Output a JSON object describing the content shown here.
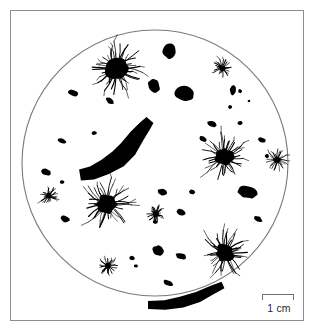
{
  "figure": {
    "caption_visible": false,
    "background_color": "#ffffff",
    "frame": {
      "border_color": "#8d8d8d",
      "x": 10,
      "y": 10,
      "width": 294,
      "height": 311
    },
    "field_of_view": {
      "shape": "circle",
      "outline_color": "#7a7a7a",
      "fill_color": "#ffffff",
      "center_x": 155,
      "center_y": 163,
      "radius": 133
    },
    "scale_bar": {
      "label": "1 cm",
      "length_px": 32,
      "tick_color": "#6f6f6f",
      "text_color": "#2a2a2a"
    },
    "ink_color": "#000000"
  },
  "chart_data": {
    "type": "scatter",
    "title": "",
    "subtitle": "",
    "xlabel": "",
    "ylabel": "",
    "grid": false,
    "legend": "none",
    "annotations": [
      "1 cm"
    ],
    "field": {
      "shape": "circle",
      "center": [
        155,
        163
      ],
      "radius": 133
    },
    "series": [
      {
        "name": "spiky-colony",
        "marker": "radiating-star",
        "count": 9,
        "points": [
          {
            "x": 116,
            "y": 68,
            "r": 15.5,
            "spikes": 40,
            "spike_len": 13
          },
          {
            "x": 224,
            "y": 157,
            "r": 13.0,
            "spikes": 38,
            "spike_len": 12
          },
          {
            "x": 107,
            "y": 204,
            "r": 13.5,
            "spikes": 38,
            "spike_len": 13
          },
          {
            "x": 225,
            "y": 253,
            "r": 12.5,
            "spikes": 36,
            "spike_len": 12
          },
          {
            "x": 277,
            "y": 160,
            "r": 5.0,
            "spikes": 22,
            "spike_len": 6
          },
          {
            "x": 222,
            "y": 68,
            "r": 4.5,
            "spikes": 20,
            "spike_len": 5
          },
          {
            "x": 49,
            "y": 196,
            "r": 4.0,
            "spikes": 20,
            "spike_len": 5
          },
          {
            "x": 156,
            "y": 214,
            "r": 4.5,
            "spikes": 20,
            "spike_len": 5
          },
          {
            "x": 108,
            "y": 266,
            "r": 4.5,
            "spikes": 20,
            "spike_len": 5
          }
        ]
      },
      {
        "name": "solid-blob",
        "marker": "irregular-ellipse",
        "count": 31,
        "points": [
          {
            "x": 169,
            "y": 51,
            "rx": 6.5,
            "ry": 7.5,
            "rot": 15
          },
          {
            "x": 154,
            "y": 86,
            "rx": 6.0,
            "ry": 7.0,
            "rot": -25
          },
          {
            "x": 185,
            "y": 94,
            "rx": 9.5,
            "ry": 8.0,
            "rot": 10
          },
          {
            "x": 233,
            "y": 90,
            "rx": 3.0,
            "ry": 5.0,
            "rot": 8
          },
          {
            "x": 240,
            "y": 91,
            "rx": 2.0,
            "ry": 2.0,
            "rot": 0
          },
          {
            "x": 249,
            "y": 101,
            "rx": 1.3,
            "ry": 1.3,
            "rot": 0
          },
          {
            "x": 73,
            "y": 93,
            "rx": 5.5,
            "ry": 3.0,
            "rot": 20
          },
          {
            "x": 110,
            "y": 101,
            "rx": 4.5,
            "ry": 2.6,
            "rot": 35
          },
          {
            "x": 94,
            "y": 133,
            "rx": 2.6,
            "ry": 2.0,
            "rot": 0
          },
          {
            "x": 62,
            "y": 141,
            "rx": 4.5,
            "ry": 2.4,
            "rot": 18
          },
          {
            "x": 46,
            "y": 172,
            "rx": 5.5,
            "ry": 3.2,
            "rot": 25
          },
          {
            "x": 65,
            "y": 219,
            "rx": 5.0,
            "ry": 3.0,
            "rot": 20
          },
          {
            "x": 212,
            "y": 124,
            "rx": 5.5,
            "ry": 3.0,
            "rot": 20
          },
          {
            "x": 240,
            "y": 123,
            "rx": 2.5,
            "ry": 2.0,
            "rot": 0
          },
          {
            "x": 203,
            "y": 139,
            "rx": 4.0,
            "ry": 2.6,
            "rot": 30
          },
          {
            "x": 262,
            "y": 140,
            "rx": 4.0,
            "ry": 2.4,
            "rot": 20
          },
          {
            "x": 247,
            "y": 192,
            "rx": 10.0,
            "ry": 6.0,
            "rot": 15
          },
          {
            "x": 258,
            "y": 219,
            "rx": 4.5,
            "ry": 2.6,
            "rot": 25
          },
          {
            "x": 162,
            "y": 192,
            "rx": 5.0,
            "ry": 3.2,
            "rot": 20
          },
          {
            "x": 192,
            "y": 192,
            "rx": 3.0,
            "ry": 2.4,
            "rot": 10
          },
          {
            "x": 181,
            "y": 212,
            "rx": 4.5,
            "ry": 3.0,
            "rot": 25
          },
          {
            "x": 159,
            "y": 248,
            "rx": 3.2,
            "ry": 2.6,
            "rot": 15
          },
          {
            "x": 132,
            "y": 258,
            "rx": 2.8,
            "ry": 2.0,
            "rot": 15
          },
          {
            "x": 158,
            "y": 251,
            "rx": 6.0,
            "ry": 4.5,
            "rot": 20
          },
          {
            "x": 181,
            "y": 256,
            "rx": 5.5,
            "ry": 3.0,
            "rot": 18
          },
          {
            "x": 168,
            "y": 283,
            "rx": 5.0,
            "ry": 2.8,
            "rot": 20
          },
          {
            "x": 155,
            "y": 222,
            "rx": 2.4,
            "ry": 2.0,
            "rot": 0
          },
          {
            "x": 267,
            "y": 156,
            "rx": 2.0,
            "ry": 2.0,
            "rot": 0
          },
          {
            "x": 62,
            "y": 182,
            "rx": 2.2,
            "ry": 2.0,
            "rot": 0
          },
          {
            "x": 230,
            "y": 107,
            "rx": 2.0,
            "ry": 2.0,
            "rot": 0
          },
          {
            "x": 136,
            "y": 266,
            "rx": 2.0,
            "ry": 1.6,
            "rot": 0
          }
        ]
      },
      {
        "name": "elongated-mass",
        "marker": "curved-streak",
        "count": 2,
        "points": [
          {
            "label": "central-streak",
            "x": 120,
            "y": 148,
            "length": 78,
            "thickness": 21
          },
          {
            "label": "bottom-streak",
            "x": 190,
            "y": 300,
            "length": 80,
            "thickness": 12
          }
        ]
      }
    ]
  }
}
